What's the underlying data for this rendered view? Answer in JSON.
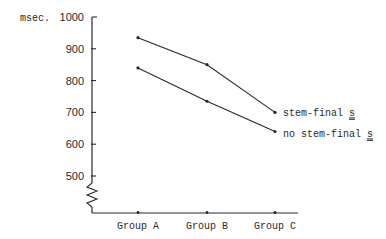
{
  "chart_data": {
    "type": "line",
    "title": "",
    "xlabel": "",
    "ylabel": "msec.",
    "ylim": [
      400,
      1000
    ],
    "y_ticks": [
      1000,
      900,
      800,
      700,
      600,
      500
    ],
    "y_axis_break": true,
    "grid": false,
    "categories": [
      "Group A",
      "Group B",
      "Group C"
    ],
    "series": [
      {
        "name": "stem-final s",
        "label_prefix": "stem-final ",
        "label_underlined": "s",
        "values": [
          935,
          850,
          700
        ]
      },
      {
        "name": "no stem-final s",
        "label_prefix": "no stem-final ",
        "label_underlined": "s",
        "values": [
          840,
          735,
          640
        ]
      }
    ],
    "legend_position": "right, direct labels at line ends"
  },
  "colors": {
    "ink": "#2a2a2a",
    "background": "#ffffff"
  }
}
